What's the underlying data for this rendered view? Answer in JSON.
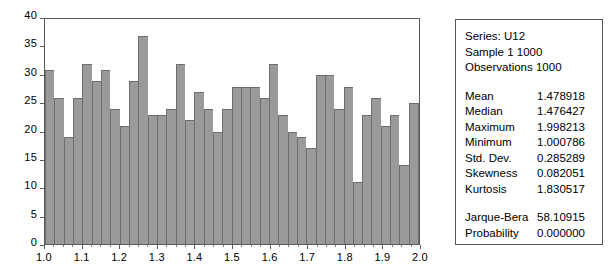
{
  "chart_data": {
    "type": "bar",
    "title": "",
    "xlabel": "",
    "ylabel": "",
    "xlim": [
      1.0,
      2.0
    ],
    "ylim": [
      0,
      40
    ],
    "grid": false,
    "legend": null,
    "bin_width": 0.025,
    "n_bins": 40,
    "y_ticks": [
      0,
      5,
      10,
      15,
      20,
      25,
      30,
      35,
      40
    ],
    "y_tick_labels": [
      "0",
      "5",
      "10",
      "15",
      "20",
      "25",
      "30",
      "35",
      "40"
    ],
    "x_ticks": [
      1.0,
      1.1,
      1.2,
      1.3,
      1.4,
      1.5,
      1.6,
      1.7,
      1.8,
      1.9,
      2.0
    ],
    "x_tick_labels": [
      "1.0",
      "1.1",
      "1.2",
      "1.3",
      "1.4",
      "1.5",
      "1.6",
      "1.7",
      "1.8",
      "1.9",
      "2.0"
    ],
    "bin_centers": [
      1.0125,
      1.0375,
      1.0625,
      1.0875,
      1.1125,
      1.1375,
      1.1625,
      1.1875,
      1.2125,
      1.2375,
      1.2625,
      1.2875,
      1.3125,
      1.3375,
      1.3625,
      1.3875,
      1.4125,
      1.4375,
      1.4625,
      1.4875,
      1.5125,
      1.5375,
      1.5625,
      1.5875,
      1.6125,
      1.6375,
      1.6625,
      1.6875,
      1.7125,
      1.7375,
      1.7625,
      1.7875,
      1.8125,
      1.8375,
      1.8625,
      1.8875,
      1.9125,
      1.9375,
      1.9625,
      1.9875
    ],
    "values": [
      31,
      26,
      19,
      26,
      32,
      29,
      31,
      24,
      21,
      29,
      37,
      23,
      23,
      24,
      32,
      22,
      27,
      24,
      20,
      24,
      28,
      28,
      28,
      26,
      32,
      23,
      20,
      19,
      17,
      30,
      30,
      24,
      28,
      11,
      23,
      26,
      21,
      23,
      14,
      25
    ],
    "bar_color": "#9a9a9a",
    "bar_border_color": "#6e6e6e",
    "axis_color": "#5a5a5a",
    "background": "#ffffff"
  },
  "stats_panel": {
    "header": [
      "Series: U12",
      "Sample 1 1000",
      "Observations 1000"
    ],
    "rows": [
      {
        "label": "Mean",
        "value": "1.478918"
      },
      {
        "label": "Median",
        "value": "1.476427"
      },
      {
        "label": "Maximum",
        "value": "1.998213"
      },
      {
        "label": "Minimum",
        "value": "1.000786"
      },
      {
        "label": "Std. Dev.",
        "value": "0.285289"
      },
      {
        "label": "Skewness",
        "value": "0.082051"
      },
      {
        "label": "Kurtosis",
        "value": "1.830517"
      }
    ],
    "test_rows": [
      {
        "label": "Jarque-Bera",
        "value": "58.10915"
      },
      {
        "label": "Probability",
        "value": "0.000000"
      }
    ]
  }
}
